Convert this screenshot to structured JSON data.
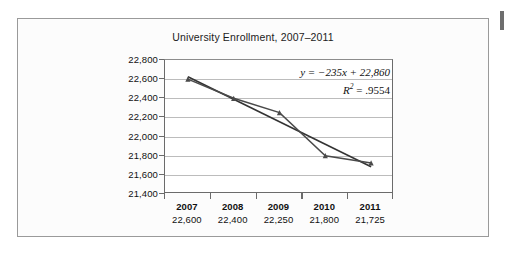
{
  "figure": {
    "title": "University Enrollment, 2007–2011",
    "edge_marker": "page-edge-mark"
  },
  "annotation": {
    "equation_y": "y",
    "equation_rest": " = −235x + 22,860",
    "r_label": "R",
    "r_exponent": "2",
    "r_value": " = .9554"
  },
  "chart_data": {
    "type": "line",
    "title": "University Enrollment, 2007–2011",
    "xlabel": "",
    "ylabel": "",
    "categories": [
      "2007",
      "2008",
      "2009",
      "2010",
      "2011"
    ],
    "values": [
      22600,
      22400,
      22250,
      21800,
      21725
    ],
    "value_labels": [
      "22,600",
      "22,400",
      "22,250",
      "21,800",
      "21,725"
    ],
    "ylim": [
      21400,
      22800
    ],
    "ytick_step": 200,
    "ytick_labels": [
      "22,800",
      "22,600",
      "22,400",
      "22,200",
      "22,000",
      "21,800",
      "21,600",
      "21,400"
    ],
    "ytick_values": [
      22800,
      22600,
      22400,
      22200,
      22000,
      21800,
      21600,
      21400
    ],
    "grid": true,
    "legend": "none",
    "series": [
      {
        "name": "Enrollment",
        "values": [
          22600,
          22400,
          22250,
          21800,
          21725
        ],
        "marker": "triangle",
        "color": "#4a4a4a"
      },
      {
        "name": "Linear trendline",
        "equation": "y = -235x + 22,860",
        "slope": -235,
        "intercept": 22860,
        "r_squared": 0.9554,
        "endpoints": [
          22625,
          21685
        ],
        "color": "#333333"
      }
    ],
    "annotations": [
      "y = −235x + 22,860",
      "R² = .9554"
    ]
  },
  "colors": {
    "card_border": "#9a9a9a",
    "card_bg": "#fcfcfc",
    "plot_bg": "#ffffff",
    "gridline": "#bcbcbc",
    "axis": "#6b6b6b",
    "series": "#4a4a4a",
    "trendline": "#333333",
    "text": "#111111"
  }
}
